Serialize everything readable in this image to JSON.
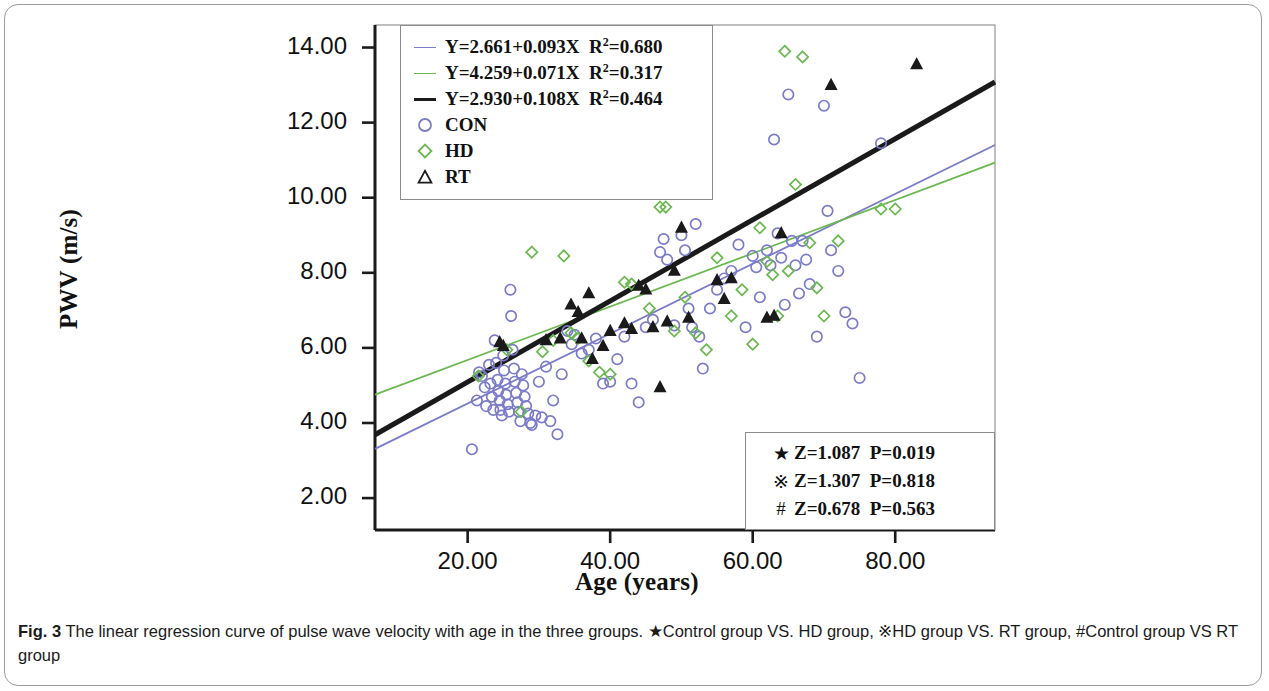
{
  "figure": {
    "label": "Fig. 3",
    "caption": "The linear regression curve of pulse wave velocity with age in the three groups. ★Control group VS. HD group, ※HD group VS. RT group, #Control group VS RT group"
  },
  "colors": {
    "con": "#7b7bc8",
    "hd": "#6ab84f",
    "rt": "#1a1a1a",
    "axis": "#1a1a1a",
    "frame": "#8c8c8c"
  },
  "legend": {
    "rows": [
      {
        "marker": "line",
        "color_key": "con",
        "text": "Y=2.661+0.093X  R²=0.680",
        "eq": "Y=2.661+0.093X",
        "r2": "0.680"
      },
      {
        "marker": "line",
        "color_key": "hd",
        "text": "Y=4.259+0.071X  R²=0.317",
        "eq": "Y=4.259+0.071X",
        "r2": "0.317"
      },
      {
        "marker": "line-thick",
        "color_key": "rt",
        "text": "Y=2.930+0.108X  R²=0.464",
        "eq": "Y=2.930+0.108X",
        "r2": "0.464"
      },
      {
        "marker": "circle-icon",
        "color_key": "con",
        "text": "CON"
      },
      {
        "marker": "diamond-icon",
        "color_key": "hd",
        "text": "HD"
      },
      {
        "marker": "triangle-icon",
        "color_key": "rt",
        "text": "RT"
      }
    ]
  },
  "stats": {
    "rows": [
      {
        "symbol": "★",
        "z": "Z=1.087",
        "p": "P=0.019"
      },
      {
        "symbol": "※",
        "z": "Z=1.307",
        "p": "P=0.818"
      },
      {
        "symbol": "#",
        "z": "Z=0.678",
        "p": "P=0.563"
      }
    ]
  },
  "chart_data": {
    "type": "scatter",
    "title": "",
    "xlabel": "Age (years)",
    "ylabel": "PWV (m/s)",
    "xlim": [
      7,
      94
    ],
    "ylim": [
      1.15,
      14.6
    ],
    "xticks": [
      "20.00",
      "40.00",
      "60.00",
      "80.00"
    ],
    "xtick_values": [
      20,
      40,
      60,
      80
    ],
    "yticks": [
      "2.00",
      "4.00",
      "6.00",
      "8.00",
      "10.00",
      "12.00",
      "14.00"
    ],
    "ytick_values": [
      2,
      4,
      6,
      8,
      10,
      12,
      14
    ],
    "grid": false,
    "legend_position": "top-left",
    "fits": [
      {
        "name": "CON",
        "color_key": "con",
        "intercept": 2.661,
        "slope": 0.093,
        "r2": 0.68,
        "width": 1.8
      },
      {
        "name": "HD",
        "color_key": "hd",
        "intercept": 4.259,
        "slope": 0.071,
        "r2": 0.317,
        "width": 1.8
      },
      {
        "name": "RT",
        "color_key": "rt",
        "intercept": 2.93,
        "slope": 0.108,
        "r2": 0.464,
        "width": 5.0
      }
    ],
    "series": [
      {
        "name": "CON",
        "marker": "circle",
        "color_key": "con",
        "points": [
          [
            20.6,
            3.3
          ],
          [
            21.3,
            4.6
          ],
          [
            21.6,
            5.35
          ],
          [
            22.0,
            5.25
          ],
          [
            22.4,
            4.95
          ],
          [
            22.6,
            4.45
          ],
          [
            23.0,
            5.55
          ],
          [
            23.2,
            5.05
          ],
          [
            23.4,
            4.7
          ],
          [
            23.6,
            4.35
          ],
          [
            23.8,
            6.2
          ],
          [
            24.0,
            5.6
          ],
          [
            24.2,
            5.15
          ],
          [
            24.3,
            4.85
          ],
          [
            24.5,
            4.6
          ],
          [
            24.6,
            4.35
          ],
          [
            24.8,
            4.2
          ],
          [
            25.0,
            5.8
          ],
          [
            25.1,
            5.4
          ],
          [
            25.3,
            5.05
          ],
          [
            25.4,
            4.75
          ],
          [
            25.6,
            4.5
          ],
          [
            25.8,
            4.3
          ],
          [
            26.0,
            7.55
          ],
          [
            26.1,
            6.85
          ],
          [
            26.3,
            5.95
          ],
          [
            26.5,
            5.45
          ],
          [
            26.6,
            5.1
          ],
          [
            26.8,
            4.8
          ],
          [
            27.0,
            4.55
          ],
          [
            27.2,
            4.3
          ],
          [
            27.4,
            4.05
          ],
          [
            27.6,
            5.3
          ],
          [
            27.8,
            5.0
          ],
          [
            28.0,
            4.7
          ],
          [
            28.2,
            4.45
          ],
          [
            28.5,
            4.25
          ],
          [
            28.8,
            4.0
          ],
          [
            29.0,
            3.95
          ],
          [
            29.5,
            4.2
          ],
          [
            30.0,
            5.1
          ],
          [
            30.4,
            4.15
          ],
          [
            31.0,
            5.5
          ],
          [
            31.6,
            4.05
          ],
          [
            32.0,
            4.6
          ],
          [
            32.6,
            3.7
          ],
          [
            33.2,
            5.3
          ],
          [
            34.0,
            6.45
          ],
          [
            34.6,
            6.1
          ],
          [
            35.0,
            6.35
          ],
          [
            36.0,
            5.85
          ],
          [
            37.0,
            5.95
          ],
          [
            38.0,
            6.25
          ],
          [
            39.0,
            5.05
          ],
          [
            40.0,
            5.1
          ],
          [
            41.0,
            5.7
          ],
          [
            42.0,
            6.3
          ],
          [
            43.0,
            5.05
          ],
          [
            44.0,
            4.55
          ],
          [
            45.0,
            6.55
          ],
          [
            46.0,
            6.75
          ],
          [
            47.0,
            8.55
          ],
          [
            47.5,
            8.9
          ],
          [
            48.0,
            8.35
          ],
          [
            49.0,
            6.6
          ],
          [
            50.0,
            9.0
          ],
          [
            50.5,
            8.6
          ],
          [
            51.0,
            7.05
          ],
          [
            51.5,
            6.55
          ],
          [
            52.0,
            9.3
          ],
          [
            52.5,
            6.3
          ],
          [
            53.0,
            5.45
          ],
          [
            54.0,
            7.05
          ],
          [
            55.0,
            7.55
          ],
          [
            56.0,
            7.85
          ],
          [
            57.0,
            8.05
          ],
          [
            58.0,
            8.75
          ],
          [
            59.0,
            6.55
          ],
          [
            60.0,
            8.45
          ],
          [
            60.5,
            8.15
          ],
          [
            61.0,
            7.35
          ],
          [
            62.0,
            8.6
          ],
          [
            62.5,
            8.2
          ],
          [
            63.0,
            11.55
          ],
          [
            63.5,
            9.05
          ],
          [
            64.0,
            8.4
          ],
          [
            64.5,
            7.15
          ],
          [
            65.0,
            12.75
          ],
          [
            65.5,
            8.85
          ],
          [
            66.0,
            8.2
          ],
          [
            66.5,
            7.45
          ],
          [
            67.0,
            8.85
          ],
          [
            67.5,
            8.35
          ],
          [
            68.0,
            7.7
          ],
          [
            69.0,
            6.3
          ],
          [
            70.0,
            12.45
          ],
          [
            70.5,
            9.65
          ],
          [
            71.0,
            8.6
          ],
          [
            72.0,
            8.05
          ],
          [
            73.0,
            6.95
          ],
          [
            74.0,
            6.65
          ],
          [
            75.0,
            5.2
          ],
          [
            78.0,
            11.45
          ]
        ]
      },
      {
        "name": "HD",
        "marker": "diamond",
        "color_key": "hd",
        "points": [
          [
            21.5,
            5.25
          ],
          [
            25.5,
            5.95
          ],
          [
            27.5,
            4.3
          ],
          [
            29.0,
            8.55
          ],
          [
            30.5,
            5.9
          ],
          [
            32.0,
            6.2
          ],
          [
            33.5,
            8.45
          ],
          [
            34.5,
            6.4
          ],
          [
            35.5,
            6.25
          ],
          [
            37.0,
            5.65
          ],
          [
            38.5,
            5.35
          ],
          [
            40.0,
            5.3
          ],
          [
            42.0,
            7.75
          ],
          [
            43.0,
            7.7
          ],
          [
            45.5,
            7.05
          ],
          [
            47.0,
            9.75
          ],
          [
            47.8,
            9.75
          ],
          [
            49.0,
            6.45
          ],
          [
            50.5,
            7.35
          ],
          [
            52.0,
            6.4
          ],
          [
            53.5,
            5.95
          ],
          [
            55.0,
            8.4
          ],
          [
            57.0,
            6.85
          ],
          [
            58.5,
            7.55
          ],
          [
            60.0,
            6.1
          ],
          [
            61.0,
            9.2
          ],
          [
            62.0,
            8.3
          ],
          [
            62.8,
            7.95
          ],
          [
            63.5,
            6.85
          ],
          [
            64.5,
            13.9
          ],
          [
            65.0,
            8.05
          ],
          [
            66.0,
            10.35
          ],
          [
            67.0,
            13.75
          ],
          [
            68.0,
            8.8
          ],
          [
            69.0,
            7.6
          ],
          [
            70.0,
            6.85
          ],
          [
            72.0,
            8.85
          ],
          [
            78.0,
            9.7
          ],
          [
            80.0,
            9.7
          ]
        ]
      },
      {
        "name": "RT",
        "marker": "triangle",
        "color_key": "rt",
        "points": [
          [
            24.5,
            6.15
          ],
          [
            25.0,
            6.05
          ],
          [
            31.0,
            6.2
          ],
          [
            33.0,
            6.25
          ],
          [
            34.5,
            7.15
          ],
          [
            35.5,
            6.95
          ],
          [
            36.0,
            6.25
          ],
          [
            37.0,
            7.45
          ],
          [
            37.5,
            5.7
          ],
          [
            38.0,
            10.35
          ],
          [
            39.0,
            6.05
          ],
          [
            40.0,
            6.45
          ],
          [
            41.0,
            11.55
          ],
          [
            42.0,
            6.65
          ],
          [
            43.0,
            6.5
          ],
          [
            44.0,
            7.65
          ],
          [
            45.0,
            7.55
          ],
          [
            46.0,
            6.55
          ],
          [
            47.0,
            4.95
          ],
          [
            48.0,
            6.7
          ],
          [
            49.0,
            8.05
          ],
          [
            50.0,
            9.2
          ],
          [
            51.0,
            6.8
          ],
          [
            53.0,
            10.25
          ],
          [
            55.0,
            7.8
          ],
          [
            56.0,
            7.3
          ],
          [
            57.0,
            7.85
          ],
          [
            62.0,
            6.8
          ],
          [
            63.0,
            6.85
          ],
          [
            64.0,
            9.05
          ],
          [
            71.0,
            13.0
          ],
          [
            83.0,
            13.55
          ]
        ]
      }
    ]
  }
}
